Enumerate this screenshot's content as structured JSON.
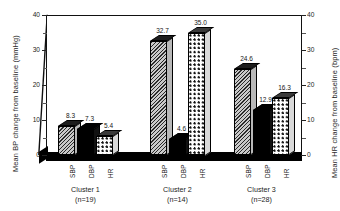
{
  "chart_data": {
    "type": "bar",
    "title": "",
    "subtitle": "",
    "categories": [
      "SBP",
      "DBP",
      "HR"
    ],
    "groups": [
      {
        "name": "Cluster 1",
        "n_label": "(n=19)",
        "values": [
          8.3,
          7.3,
          5.4
        ],
        "value_labels": [
          "8.3",
          "7.3",
          "5.4"
        ]
      },
      {
        "name": "Cluster 2",
        "n_label": "(n=14)",
        "values": [
          32.7,
          4.6,
          35.0
        ],
        "value_labels": [
          "32.7",
          "4.6",
          "35.0"
        ]
      },
      {
        "name": "Cluster 3",
        "n_label": "(n=28)",
        "values": [
          24.6,
          12.9,
          16.3
        ],
        "value_labels": [
          "24.6",
          "12.9",
          "16.3"
        ]
      }
    ],
    "series": [
      {
        "name": "SBP",
        "values": [
          8.3,
          32.7,
          24.6
        ],
        "fill": "diagonal-hatch"
      },
      {
        "name": "DBP",
        "values": [
          7.3,
          4.6,
          12.9
        ],
        "fill": "solid-black"
      },
      {
        "name": "HR",
        "values": [
          5.4,
          35.0,
          16.3
        ],
        "fill": "dotted"
      }
    ],
    "xlabel": "",
    "ylabel": "Mean BP change from baseline (mmHg)",
    "y2label": "Mean HR change from baseline (bpm)",
    "ylim": [
      0,
      40
    ],
    "y2lim": [
      0,
      40
    ],
    "yticks": [
      "0",
      "10",
      "20",
      "30",
      "40"
    ],
    "y2ticks": [
      "0",
      "10",
      "20",
      "30",
      "40"
    ],
    "minor_tick_step": 5,
    "grid": false,
    "legend": "none",
    "style": "3d-bar"
  },
  "axes": {
    "left_title": "Mean BP change from baseline (mmHg)",
    "right_title": "Mean HR change from baseline (bpm)",
    "left_ticks": [
      "40",
      "30",
      "20",
      "10",
      "0"
    ],
    "right_ticks": [
      "40",
      "30",
      "20",
      "10",
      "0"
    ]
  }
}
